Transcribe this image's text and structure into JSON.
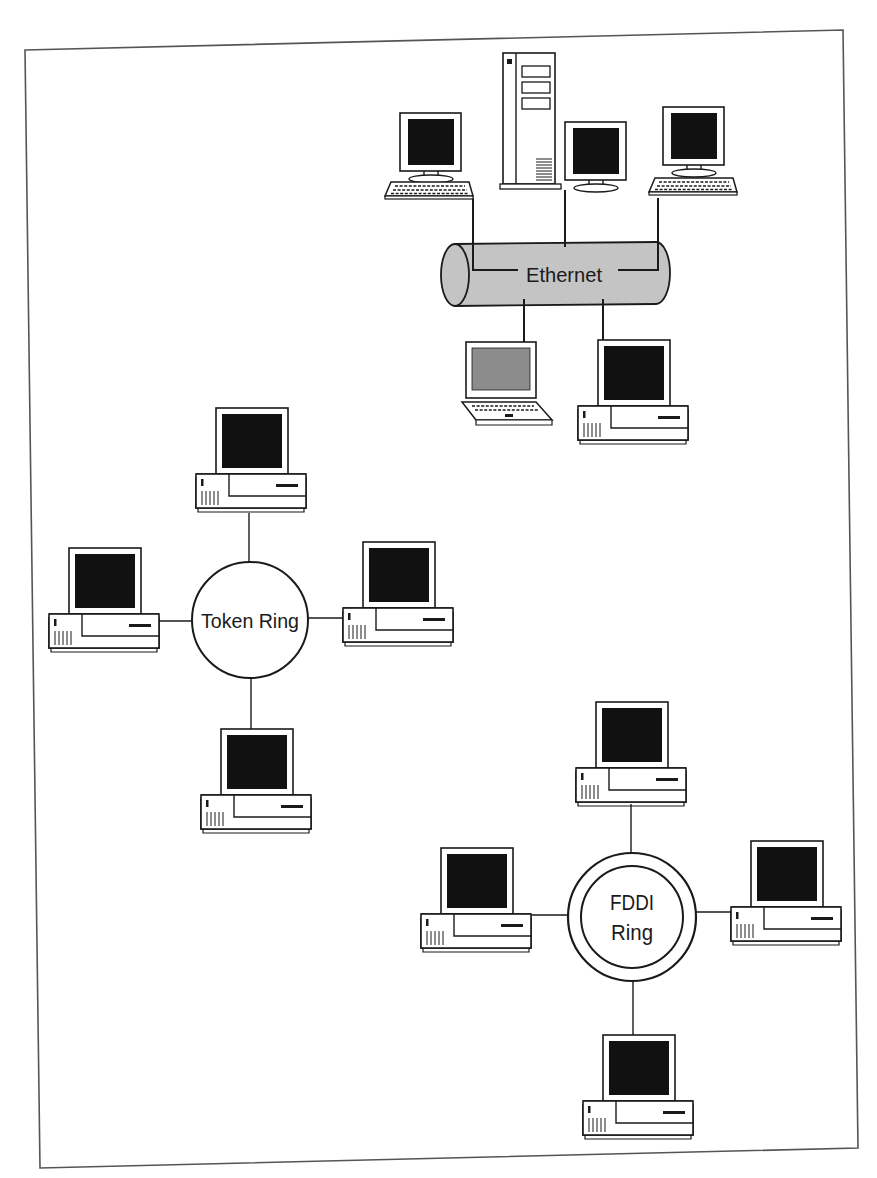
{
  "diagram": {
    "type": "network-topologies",
    "frame": {
      "corners": [
        [
          25,
          50
        ],
        [
          843,
          30
        ],
        [
          858,
          1148
        ],
        [
          40,
          1168
        ]
      ]
    },
    "colors": {
      "line": "#1a1a1a",
      "screen": "#111111",
      "laptop_screen": "#8c8c8c",
      "bus_fill": "#c4c4c4",
      "paper": "#ffffff"
    },
    "networks": [
      {
        "id": "ethernet",
        "label": "Ethernet",
        "shape": "bus-cylinder",
        "bus": {
          "x": 440,
          "y": 243,
          "w": 230,
          "h": 62
        },
        "nodes": [
          {
            "id": "eth-workstation-left",
            "kind": "monitor-keyboard",
            "x": 385,
            "y": 113
          },
          {
            "id": "eth-server",
            "kind": "tower-server",
            "x": 503,
            "y": 53
          },
          {
            "id": "eth-monitor-center",
            "kind": "monitor",
            "x": 565,
            "y": 122
          },
          {
            "id": "eth-workstation-right",
            "kind": "monitor-keyboard",
            "x": 648,
            "y": 107
          },
          {
            "id": "eth-laptop",
            "kind": "laptop",
            "x": 460,
            "y": 342
          },
          {
            "id": "eth-desktop",
            "kind": "desktop",
            "x": 578,
            "y": 340
          }
        ]
      },
      {
        "id": "token-ring",
        "label": "Token Ring",
        "shape": "ring",
        "ring": {
          "cx": 250,
          "cy": 620,
          "r": 58
        },
        "nodes": [
          {
            "id": "tr-desktop-top",
            "kind": "desktop",
            "x": 196,
            "y": 408
          },
          {
            "id": "tr-desktop-left",
            "kind": "desktop",
            "x": 49,
            "y": 548
          },
          {
            "id": "tr-desktop-right",
            "kind": "desktop",
            "x": 343,
            "y": 542
          },
          {
            "id": "tr-desktop-bottom",
            "kind": "desktop",
            "x": 201,
            "y": 729
          }
        ]
      },
      {
        "id": "fddi-ring",
        "label_lines": [
          "FDDI",
          "Ring"
        ],
        "shape": "double-ring",
        "ring": {
          "cx": 632,
          "cy": 917,
          "r_outer": 64,
          "r_inner": 52
        },
        "nodes": [
          {
            "id": "fddi-desktop-top",
            "kind": "desktop",
            "x": 576,
            "y": 702
          },
          {
            "id": "fddi-desktop-left",
            "kind": "desktop",
            "x": 421,
            "y": 848
          },
          {
            "id": "fddi-desktop-right",
            "kind": "desktop",
            "x": 731,
            "y": 841
          },
          {
            "id": "fddi-desktop-bottom",
            "kind": "desktop",
            "x": 583,
            "y": 1035
          }
        ]
      }
    ],
    "links": [
      [
        [
          473,
          198
        ],
        [
          473,
          270
        ],
        [
          518,
          270
        ]
      ],
      [
        [
          565,
          190
        ],
        [
          565,
          247
        ]
      ],
      [
        [
          658,
          198
        ],
        [
          658,
          270
        ],
        [
          618,
          270
        ]
      ],
      [
        [
          524,
          299
        ],
        [
          524,
          342
        ]
      ],
      [
        [
          603,
          299
        ],
        [
          603,
          342
        ]
      ],
      [
        [
          249,
          513
        ],
        [
          249,
          562
        ]
      ],
      [
        [
          159,
          620
        ],
        [
          192,
          620
        ]
      ],
      [
        [
          308,
          617
        ],
        [
          343,
          617
        ]
      ],
      [
        [
          251,
          678
        ],
        [
          251,
          730
        ]
      ],
      [
        [
          631,
          804
        ],
        [
          631,
          853
        ]
      ],
      [
        [
          531,
          915
        ],
        [
          568,
          915
        ]
      ],
      [
        [
          696,
          912
        ],
        [
          731,
          912
        ]
      ],
      [
        [
          633,
          981
        ],
        [
          633,
          1035
        ]
      ]
    ]
  }
}
